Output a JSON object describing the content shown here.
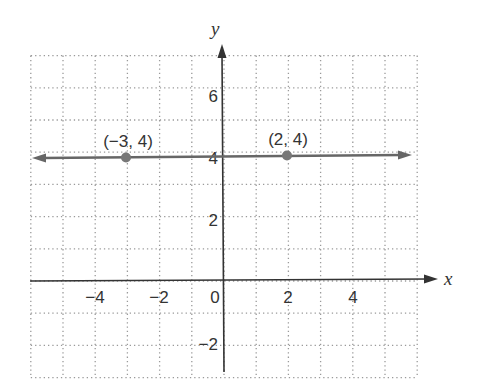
{
  "chart_data": {
    "type": "line",
    "title": "",
    "xlabel": "x",
    "ylabel": "y",
    "xlim": [
      -6,
      6
    ],
    "ylim": [
      -3,
      7
    ],
    "grid": true,
    "grid_style": "dotted",
    "x_ticks": [
      -4,
      -2,
      0,
      2,
      4
    ],
    "x_tick_labels": [
      "−4",
      "−2",
      "0",
      "2",
      "4"
    ],
    "y_ticks": [
      -2,
      2,
      4,
      6
    ],
    "y_tick_labels": [
      "−2",
      "2",
      "4",
      "6"
    ],
    "series": [
      {
        "name": "y = 4",
        "type": "line",
        "x": [
          -6,
          6
        ],
        "y": [
          4,
          4
        ],
        "arrows": "both"
      }
    ],
    "points": [
      {
        "x": -3,
        "y": 4,
        "label": "(−3, 4)"
      },
      {
        "x": 2,
        "y": 4,
        "label": "(2, 4)"
      }
    ],
    "colors": {
      "axis": "#333333",
      "grid": "#9a9a9a",
      "line": "#666666",
      "point": "#777777"
    }
  }
}
